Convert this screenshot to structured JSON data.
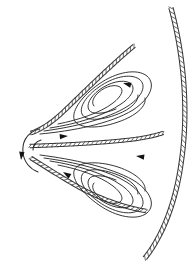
{
  "figure": {
    "title": "Counter-rotating vortex pair between hatched boundaries",
    "kind": "technical-line-diagram",
    "background_color": "#ffffff",
    "line_color": "#2b2b2b",
    "hatch_color": "#3a3a3a",
    "arrow_color": "#141414",
    "canvas": {
      "width": 195,
      "height": 266
    }
  },
  "boundaries": [
    {
      "id": "outer-right-arc",
      "label": "outer hatched arc",
      "hatch_side": "left",
      "path": "M 171 8 C 184 56, 189 112, 181 164 C 175 206, 161 238, 145 258",
      "rail_offset": 4.2,
      "tick_spacing": 5.0
    },
    {
      "id": "upper-hatched-branch",
      "label": "upper hatched branch",
      "hatch_side": "right",
      "path": "M 134 46 C 110 66, 84 92, 62 113 C 50 124, 40 130, 31 133",
      "rail_offset": 3.6,
      "tick_spacing": 4.6
    },
    {
      "id": "middle-hatched-branch",
      "label": "middle hatched branch",
      "hatch_side": "top",
      "path": "M 30 146 C 62 145, 104 143, 136 139 C 149 137, 157 135, 163 133",
      "rail_offset": 3.4,
      "tick_spacing": 4.4
    },
    {
      "id": "lower-hatched-branch",
      "label": "lower hatched branch",
      "hatch_side": "left",
      "path": "M 31 158 C 44 166, 62 178, 84 190 C 106 201, 128 208, 146 211",
      "rail_offset": 3.6,
      "tick_spacing": 4.6
    }
  ],
  "nose": {
    "id": "left-nose",
    "label": "left nose cap",
    "arc_path": "M 39 129 C 25 133, 22 144, 23 153 C 24 162, 30 169, 38 172",
    "inner_path": "M 41 140 C 35 142, 33 146, 33 150"
  },
  "vortices": [
    {
      "id": "upper-vortex",
      "label": "upper recirculation vortex",
      "rotation": "clockwise",
      "center": [
        113,
        110
      ],
      "streamlines": [
        "M 40 134 C 72 131, 110 124, 133 110 C 151 98, 156 84, 147 76 C 137 68, 116 72, 99 84 C 82 96, 72 110, 74 119 C 76 128, 96 130, 118 122 C 136 116, 147 106, 145 98",
        "M 44 131 C 74 127, 108 119, 128 106 C 143 96, 147 85, 139 79 C 130 73, 113 77, 99 87 C 86 96, 79 107, 82 114 C 85 121, 101 121, 118 114 C 131 109, 139 101, 138 95",
        "M 50 128 C 76 124, 104 116, 121 104 C 133 96, 136 87, 130 83 C 123 79, 110 82, 99 90 C 90 97, 86 105, 89 110 C 92 115, 104 114, 116 109",
        "M 58 124 C 78 120, 100 113, 113 103 C 122 96, 124 90, 120 87 C 115 84, 106 86, 99 92 C 93 97, 91 103, 94 106"
      ],
      "arrows": [
        {
          "x": 123,
          "y": 83,
          "angle": 196,
          "name": "upper-vortex-top-arrow"
        },
        {
          "x": 68,
          "y": 136,
          "angle": 356,
          "name": "upper-vortex-bottom-arrow"
        }
      ]
    },
    {
      "id": "lower-vortex",
      "label": "lower recirculation vortex",
      "rotation": "counter-clockwise",
      "center": [
        113,
        178
      ],
      "streamlines": [
        "M 40 155 C 72 159, 110 167, 133 180 C 151 191, 156 205, 147 213 C 137 221, 116 217, 99 205 C 82 193, 72 180, 74 171 C 76 162, 96 160, 118 167 C 136 173, 147 183, 145 191",
        "M 44 158 C 74 162, 108 170, 128 183 C 143 193, 147 204, 139 210 C 130 216, 113 212, 99 202 C 86 193, 79 182, 82 175 C 85 168, 101 168, 118 175 C 131 180, 139 188, 138 194",
        "M 50 161 C 76 165, 104 173, 121 185 C 133 193, 136 202, 130 206 C 123 210, 110 207, 99 199 C 90 192, 86 184, 89 179 C 92 174, 104 175, 116 180",
        "M 58 165 C 78 169, 100 176, 113 186 C 122 193, 124 199, 120 202 C 115 205, 106 203, 99 197 C 93 192, 91 186, 94 183"
      ],
      "arrows": [
        {
          "x": 136,
          "y": 156,
          "angle": 188,
          "name": "lower-vortex-top-arrow"
        },
        {
          "x": 63,
          "y": 172,
          "angle": 212,
          "name": "lower-vortex-left-arrow"
        }
      ]
    }
  ],
  "nose_arrow": {
    "x": 21,
    "y": 160,
    "angle": 96,
    "name": "nose-downward-arrow",
    "label": "downward flow arrow at nose"
  }
}
